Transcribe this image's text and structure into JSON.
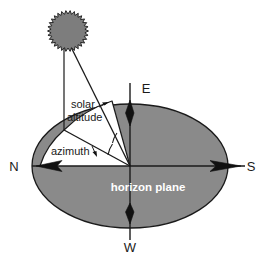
{
  "diagram": {
    "type": "solar-geometry-diagram",
    "colors": {
      "plane_fill": "#8a8a8a",
      "plane_stroke": "#1a1a1a",
      "sun_fill": "#7d7d7d",
      "sun_stroke": "#1a1a1a",
      "line": "#1a1a1a",
      "background": "#ffffff",
      "plane_label_text": "#ffffff",
      "label_text": "#1a1a1a"
    },
    "plane": {
      "label": "horizon plane",
      "label_x": 150,
      "label_y": 190,
      "center_x": 130,
      "center_y": 166,
      "radius_x": 98,
      "radius_y": 62
    },
    "sun": {
      "name": "sun",
      "center_x": 68,
      "center_y": 31,
      "radius": 17,
      "spikes": 30,
      "spike_length": 3.5
    },
    "origin": {
      "x": 130,
      "y": 166
    },
    "compass": [
      {
        "label": "N",
        "x": 14,
        "y": 171,
        "axis_end_x": 32,
        "axis_end_y": 166,
        "arrow_at_x": 46,
        "arrow_at_y": 166,
        "arrow_dir": "right"
      },
      {
        "label": "E",
        "x": 146,
        "y": 93,
        "axis_end_x": 130,
        "axis_end_y": 83,
        "arrow_at_x": 130,
        "arrow_at_y": 98,
        "arrow_dir": "down"
      },
      {
        "label": "S",
        "x": 249,
        "y": 171,
        "axis_end_x": 245,
        "axis_end_y": 166,
        "arrow_at_x": 218,
        "arrow_at_y": 166,
        "arrow_dir": "left"
      },
      {
        "label": "W",
        "x": 124,
        "y": 251,
        "axis_end_x": 130,
        "axis_end_y": 240,
        "arrow_at_x": 130,
        "arrow_at_y": 226,
        "arrow_dir": "up"
      }
    ],
    "angles": [
      {
        "name": "solar-altitude",
        "label_line_1": "solar",
        "label_line_2": "altitude",
        "label_x": 71,
        "label_y": 111,
        "leader_from_x": 99,
        "leader_from_y": 108,
        "leader_to_x": 107,
        "leader_to_y": 104
      },
      {
        "name": "azimuth",
        "label": "azimuth",
        "label_x": 51,
        "label_y": 152,
        "leader_from_x": 92,
        "leader_from_y": 148,
        "leader_to_x": 96,
        "leader_to_y": 156
      }
    ],
    "rays": {
      "sun_to_origin": {
        "x1": 71,
        "y1": 48,
        "x2": 130,
        "y2": 166
      },
      "sun_drop_vertical": {
        "x1": 64,
        "y1": 48,
        "x2": 64,
        "y2": 130
      },
      "ground_projection": {
        "x1": 64,
        "y1": 130,
        "x2": 130,
        "y2": 166
      },
      "north_segment": {
        "x1": 40,
        "y1": 166,
        "x2": 130,
        "y2": 166
      }
    },
    "wedge_arc": {
      "note": "white unshaded sector bounded by arc from north axis to sun ground line"
    }
  }
}
